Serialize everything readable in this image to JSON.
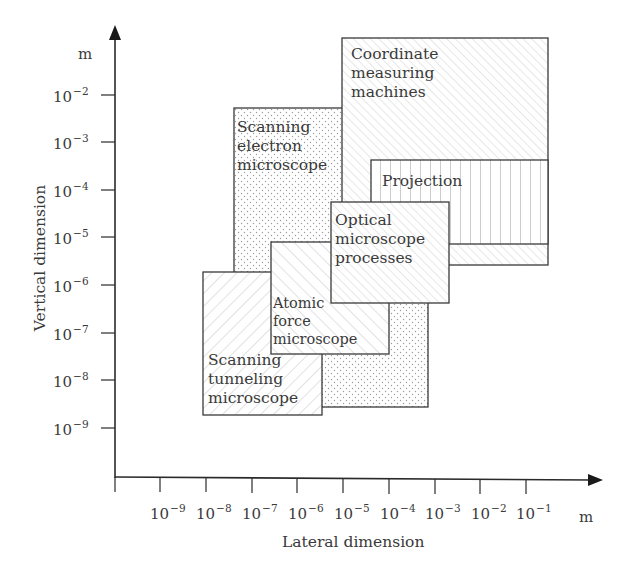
{
  "figure": {
    "x_axis": {
      "title": "Lateral dimension",
      "unit": "m",
      "ticks": [
        {
          "base": "10",
          "exp": "−9"
        },
        {
          "base": "10",
          "exp": "−8"
        },
        {
          "base": "10",
          "exp": "−7"
        },
        {
          "base": "10",
          "exp": "−6"
        },
        {
          "base": "10",
          "exp": "−5"
        },
        {
          "base": "10",
          "exp": "−4"
        },
        {
          "base": "10",
          "exp": "−3"
        },
        {
          "base": "10",
          "exp": "−2"
        },
        {
          "base": "10",
          "exp": "−1"
        }
      ]
    },
    "y_axis": {
      "title": "Vertical dimension",
      "unit": "m",
      "ticks": [
        {
          "base": "10",
          "exp": "−2"
        },
        {
          "base": "10",
          "exp": "−3"
        },
        {
          "base": "10",
          "exp": "−4"
        },
        {
          "base": "10",
          "exp": "−5"
        },
        {
          "base": "10",
          "exp": "−6"
        },
        {
          "base": "10",
          "exp": "−7"
        },
        {
          "base": "10",
          "exp": "−8"
        },
        {
          "base": "10",
          "exp": "−9"
        }
      ]
    },
    "regions": [
      {
        "id": "scanning-electron-microscope",
        "label": "Scanning\nelectron\nmicroscope",
        "pattern": "dots",
        "lateral_range_m": [
          "1e-8",
          "1e-4"
        ],
        "vertical_range_m": [
          "1e-9",
          "5e-3"
        ]
      },
      {
        "id": "coordinate-measuring-machines",
        "label": "Coordinate\nmeasuring\nmachines",
        "pattern": "fine-diagonal",
        "lateral_range_m": [
          "1e-5",
          "1e0"
        ],
        "vertical_range_m": [
          "3e-6",
          "1e-1"
        ]
      },
      {
        "id": "projection",
        "label": "Projection",
        "pattern": "vertical-lines",
        "lateral_range_m": [
          "1e-4",
          "1e0"
        ],
        "vertical_range_m": [
          "7e-6",
          "4e-4"
        ]
      },
      {
        "id": "scanning-tunneling-microscope",
        "label": "Scanning\ntunneling\nmicroscope",
        "pattern": "diagonal",
        "lateral_range_m": [
          "1e-9",
          "1e-6"
        ],
        "vertical_range_m": [
          "2e-10",
          "2e-6"
        ]
      },
      {
        "id": "atomic-force-microscope",
        "label": "Atomic\nforce\nmicroscope",
        "pattern": "diagonal-back",
        "lateral_range_m": [
          "1e-7",
          "5e-4"
        ],
        "vertical_range_m": [
          "3e-8",
          "8e-6"
        ]
      },
      {
        "id": "optical-microscope-processes",
        "label": "Optical\nmicroscope\nprocesses",
        "pattern": "fine-diagonal",
        "lateral_range_m": [
          "1e-6",
          "5e-3"
        ],
        "vertical_range_m": [
          "4e-7",
          "5e-5"
        ]
      }
    ],
    "colors": {
      "line": "#3a3a3a",
      "pattern": "#b8b8b8",
      "background": "#ffffff"
    }
  }
}
